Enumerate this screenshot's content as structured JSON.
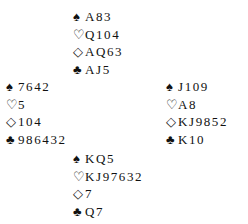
{
  "deal": {
    "north": {
      "spades": "A83",
      "hearts": "Q104",
      "diamonds": "AQ63",
      "clubs": "AJ5"
    },
    "west": {
      "spades": "7642",
      "hearts": "5",
      "diamonds": "104",
      "clubs": "986432"
    },
    "east": {
      "spades": "J109",
      "hearts": "A8",
      "diamonds": "KJ9852",
      "clubs": "K10"
    },
    "south": {
      "spades": "KQ5",
      "hearts": "KJ97632",
      "diamonds": "7",
      "clubs": "Q7"
    }
  },
  "suit_symbols": {
    "spades": "♠",
    "hearts": "♡",
    "diamonds": "◇",
    "clubs": "♣"
  }
}
